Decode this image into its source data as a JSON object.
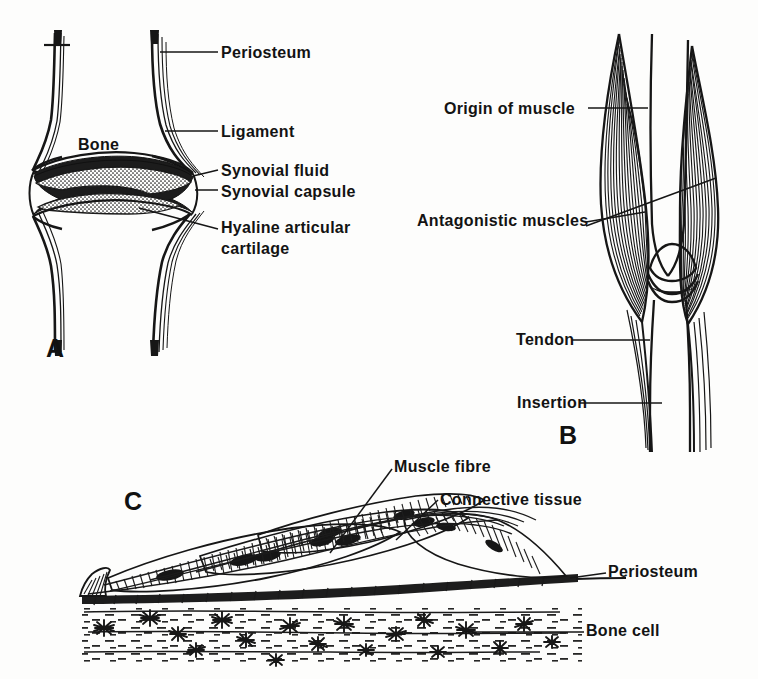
{
  "figure": {
    "background_color": "#fdfdfc",
    "ink_color": "#161616"
  },
  "panels": [
    {
      "letter": "A",
      "name": "synovial-joint-section",
      "labels": [
        {
          "key": "periosteum",
          "text": "Periosteum"
        },
        {
          "key": "ligament",
          "text": "Ligament"
        },
        {
          "key": "syn_fluid",
          "text": "Synovial fluid"
        },
        {
          "key": "syn_capsule",
          "text": "Synovial capsule"
        },
        {
          "key": "hyaline_1",
          "text": "Hyaline articular"
        },
        {
          "key": "hyaline_2",
          "text": "cartilage"
        },
        {
          "key": "bone",
          "text": "Bone"
        }
      ]
    },
    {
      "letter": "B",
      "name": "antagonistic-muscles",
      "labels": [
        {
          "key": "origin",
          "text": "Origin of muscle"
        },
        {
          "key": "antagonistic",
          "text": "Antagonistic muscles"
        },
        {
          "key": "tendon",
          "text": "Tendon"
        },
        {
          "key": "insertion",
          "text": "Insertion"
        }
      ]
    },
    {
      "letter": "C",
      "name": "muscle-bone-attachment-detail",
      "labels": [
        {
          "key": "muscle_fibre",
          "text": "Muscle fibre"
        },
        {
          "key": "connective",
          "text": "Connective tissue"
        },
        {
          "key": "periosteum",
          "text": "Periosteum"
        },
        {
          "key": "bone_cell",
          "text": "Bone cell"
        }
      ]
    }
  ],
  "textA": {
    "periosteum": "Periosteum",
    "ligament": "Ligament",
    "synovial_fluid": "Synovial fluid",
    "synovial_capsule": "Synovial capsule",
    "hyaline_line1": "Hyaline articular",
    "hyaline_line2": "cartilage",
    "bone": "Bone",
    "letter": "A"
  },
  "textB": {
    "origin_of_muscle": "Origin of muscle",
    "antagonistic_muscles": "Antagonistic muscles",
    "tendon": "Tendon",
    "insertion": "Insertion",
    "letter": "B"
  },
  "textC": {
    "muscle_fibre": "Muscle fibre",
    "connective_tissue": "Connective tissue",
    "periosteum": "Periosteum",
    "bone_cell": "Bone cell",
    "letter": "C"
  }
}
